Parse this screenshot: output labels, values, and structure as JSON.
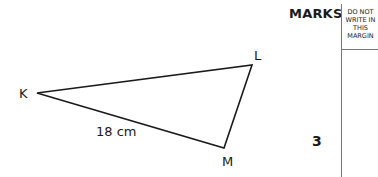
{
  "header": {
    "marks_label": "MARKS",
    "margin_note": "DO NOT WRITE IN THIS MARGIN"
  },
  "diagram": {
    "shape": "triangle",
    "vertices": {
      "K": {
        "label": "K",
        "x": 37,
        "y": 93
      },
      "L": {
        "label": "L",
        "x": 252,
        "y": 65
      },
      "M": {
        "label": "M",
        "x": 224,
        "y": 148
      }
    },
    "side_label": "18 cm",
    "side_label_edge": "KM"
  },
  "marks": {
    "value": "3"
  }
}
